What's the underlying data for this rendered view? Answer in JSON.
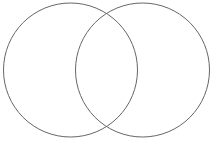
{
  "diagram": {
    "type": "venn",
    "sets": [
      {
        "name": "left-circle",
        "cx": 70.5,
        "cy": 70,
        "r": 67
      },
      {
        "name": "right-circle",
        "cx": 142.5,
        "cy": 70,
        "r": 67
      }
    ],
    "stroke_color": "#666666",
    "background": "#ffffff"
  }
}
